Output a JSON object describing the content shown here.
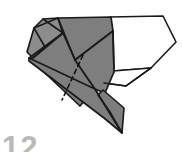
{
  "figure": {
    "kind": "origami-fold-diagram",
    "step_number": "12",
    "colors": {
      "paper_front": "#ffffff",
      "paper_back_shade": "#7e7e7e",
      "paper_back_shade_light": "#8c8c8c",
      "paper_back_shade_dark": "#6f6f6f",
      "outline": "#1a1a1a",
      "crease_dashed": "#111111",
      "step_number_color": "#b9b9b9",
      "background": "#ffffff"
    },
    "shapes": [
      {
        "name": "upper-left-shaded-flap",
        "fill": "paper_back_shade_light",
        "points": "27,52 33,29 42,20 57,18 62,32 44,46 32,57"
      },
      {
        "name": "top-shaded-main-panel",
        "fill": "paper_back_shade",
        "points": "57,18 110,17 112,30 74,59 62,32"
      },
      {
        "name": "left-shaded-body",
        "fill": "paper_back_shade",
        "points": "32,57 62,32 74,59 93,88 79,104 30,57"
      },
      {
        "name": "lower-long-shaded-spike",
        "fill": "paper_back_shade",
        "points": "30,57 93,88 120,131 106,120 31,60"
      },
      {
        "name": "right-shaded-vertical-panel",
        "fill": "paper_back_shade",
        "points": "74,59 112,30 116,72 104,92 93,88"
      },
      {
        "name": "lower-right-shaded-spike",
        "fill": "paper_back_shade",
        "points": "104,92 121,106 122,131 110,113 99,96"
      },
      {
        "name": "white-right-panel",
        "fill": "paper_front",
        "points": "110,17 163,16 176,42 151,68 113,71"
      }
    ],
    "creases": [
      {
        "name": "crease-top-left-ridge",
        "type": "solid",
        "d": "M 33,29 L 57,18"
      },
      {
        "name": "crease-left-fold",
        "type": "solid",
        "d": "M 42,20 L 62,32"
      },
      {
        "name": "crease-left-inner",
        "type": "solid",
        "d": "M 33,29 L 44,46"
      },
      {
        "name": "crease-center-ridge",
        "type": "solid",
        "d": "M 57,18 L 74,59"
      },
      {
        "name": "crease-diagonal-body",
        "type": "solid",
        "d": "M 62,32 L 32,57"
      },
      {
        "name": "crease-long-spike-edge",
        "type": "solid",
        "d": "M 30,57 L 120,131"
      },
      {
        "name": "crease-panel-divider",
        "type": "solid",
        "d": "M 112,30 L 113,71"
      },
      {
        "name": "valley-fold-dashed",
        "type": "dashed",
        "d": "M 82,56 L 62,99"
      }
    ],
    "labels": {
      "step": "12"
    }
  }
}
